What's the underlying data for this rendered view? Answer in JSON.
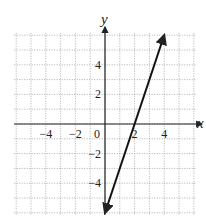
{
  "chart_data": {
    "type": "line",
    "title": "",
    "xlabel": "x",
    "ylabel": "y",
    "xlim": [
      -6,
      6
    ],
    "ylim": [
      -6,
      6
    ],
    "grid": true,
    "x_ticks": [
      -4,
      -2,
      0,
      2,
      4
    ],
    "y_ticks": [
      -4,
      -2,
      2,
      4
    ],
    "x_tick_labels": [
      "−4",
      "−2",
      "0",
      "2",
      "4"
    ],
    "y_tick_labels": [
      "−4",
      "−2",
      "2",
      "4"
    ],
    "series": [
      {
        "name": "line",
        "equation": "y = 3x - 6",
        "x": [
          0,
          2,
          4
        ],
        "y": [
          -6,
          0,
          6
        ],
        "arrows": "both",
        "color": "#111111"
      }
    ]
  },
  "colors": {
    "grid": "#9a9a9a",
    "axis": "#222222",
    "line": "#111111"
  }
}
